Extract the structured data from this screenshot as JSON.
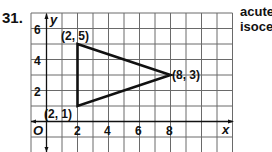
{
  "problem": {
    "number": "31.",
    "classification_line1": "acute",
    "classification_line2": "isoceles"
  },
  "graph": {
    "x_axis_label": "x",
    "y_axis_label": "y",
    "origin_label": "O",
    "x_ticks": [
      "2",
      "4",
      "6",
      "8"
    ],
    "y_ticks": [
      "6",
      "4",
      "2"
    ],
    "vertices": [
      {
        "label": "(2, 5)",
        "x": 2,
        "y": 5
      },
      {
        "label": "(8, 3)",
        "x": 8,
        "y": 3
      },
      {
        "label": "(2, 1)",
        "x": 2,
        "y": 1
      }
    ],
    "colors": {
      "grid": "#555555",
      "triangle": "#111111"
    }
  }
}
